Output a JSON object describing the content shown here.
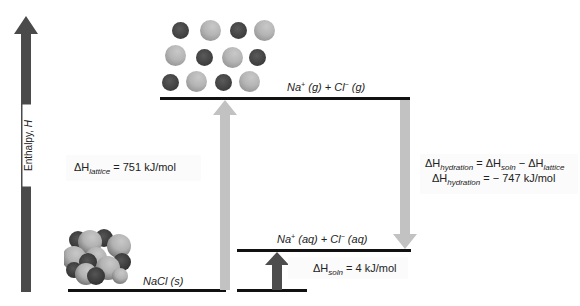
{
  "axis": {
    "label": "Enthalpy, ",
    "label_var": "H",
    "direction": "up",
    "color": "#4a4a4a"
  },
  "levels": {
    "gas": {
      "species1": "Na",
      "charge1": "+",
      "state1": " (g) + ",
      "species2": "Cl",
      "charge2": "−",
      "state2": " (g)"
    },
    "aqueous": {
      "species1": "Na",
      "charge1": "+",
      "state1": " (aq) + ",
      "species2": "Cl",
      "charge2": "−",
      "state2": " (aq)"
    },
    "solid": {
      "text": "NaCl (s)"
    }
  },
  "arrows": {
    "lattice": {
      "symbol": "ΔH",
      "subscript": "lattice",
      "value": " = 751 kJ/mol",
      "direction": "up",
      "color": "#c2c2c2"
    },
    "hydration": {
      "line1_symbol": "ΔH",
      "line1_sub": "hydration",
      "line1_mid": " = ΔH",
      "line1_sub2": "soln",
      "line1_mid2": " − ΔH",
      "line1_sub3": "lattice",
      "line2_symbol": "ΔH",
      "line2_sub": "hydration",
      "line2_value": " = − 747 kJ/mol",
      "direction": "down",
      "color": "#c2c2c2"
    },
    "solution": {
      "symbol": "ΔH",
      "subscript": "soln",
      "value": " = 4 kJ/mol",
      "direction": "up",
      "color": "#4d4d4d"
    }
  },
  "illustrations": {
    "gas_ions": "separated-ions-icon",
    "solid_crystal": "nacl-crystal-icon"
  },
  "colors": {
    "level_line": "#111111",
    "light_arrow": "#c2c2c2",
    "dark_arrow": "#4d4d4d",
    "na_ion": "#3d3d3d",
    "cl_ion": "#b5b5b5"
  }
}
